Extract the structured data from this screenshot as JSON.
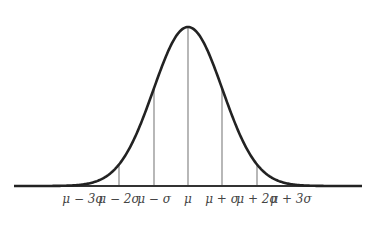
{
  "diagram": {
    "type": "normal-distribution",
    "colors": {
      "curve": "#222222",
      "baseline": "#333333",
      "vlines": "#888888",
      "labels": "#444444"
    },
    "labels": [
      {
        "id": "m3",
        "text": "μ − 3σ",
        "x": 83
      },
      {
        "id": "m2",
        "text": "μ − 2σ",
        "x": 119
      },
      {
        "id": "m1",
        "text": "μ − σ",
        "x": 154
      },
      {
        "id": "mu",
        "text": "μ",
        "x": 188
      },
      {
        "id": "p1",
        "text": "μ + σ",
        "x": 222
      },
      {
        "id": "p2",
        "text": "μ + 2σ",
        "x": 257
      },
      {
        "id": "p3",
        "text": "μ + 3σ",
        "x": 291
      }
    ],
    "geometry": {
      "mean_x": 188,
      "sigma_px": 34.5,
      "baseline_y": 186,
      "peak_y": 27,
      "x_start": 14,
      "x_end": 362
    }
  },
  "chart_data": {
    "type": "line",
    "title": "",
    "xlabel": "",
    "ylabel": "",
    "categories": [
      "μ-3σ",
      "μ-2σ",
      "μ-σ",
      "μ",
      "μ+σ",
      "μ+2σ",
      "μ+3σ"
    ],
    "x": [
      -3,
      -2,
      -1,
      0,
      1,
      2,
      3
    ],
    "values": [
      0.0044,
      0.054,
      0.242,
      0.399,
      0.242,
      0.054,
      0.0044
    ],
    "grid": false,
    "legend": null
  }
}
